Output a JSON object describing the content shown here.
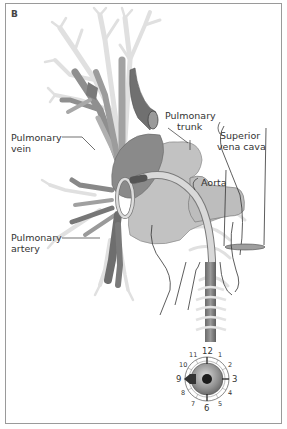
{
  "figure": {
    "panel_label": "B",
    "labels": {
      "pulmonary_vein": [
        "Pulmonary",
        "vein"
      ],
      "pulmonary_trunk": [
        "Pulmonary",
        "trunk"
      ],
      "superior_vena_cava": [
        "Superior",
        "vena cava"
      ],
      "aorta": "Aorta",
      "pulmonary_artery": [
        "Pulmonary",
        "artery"
      ]
    },
    "clock_dial": {
      "numbers": [
        "12",
        "1",
        "2",
        "3",
        "4",
        "5",
        "6",
        "7",
        "8",
        "9",
        "10",
        "11"
      ],
      "indicator_position": "9"
    },
    "colors": {
      "frame": "#9a9a9a",
      "lung_tree_light": "#e2e2e2",
      "vessel_mid": "#a8a8a8",
      "vessel_dark": "#6e6e6e",
      "heart_fill": "#c2c2c2",
      "catheter": "#d8d8d8",
      "line": "#333333"
    }
  }
}
